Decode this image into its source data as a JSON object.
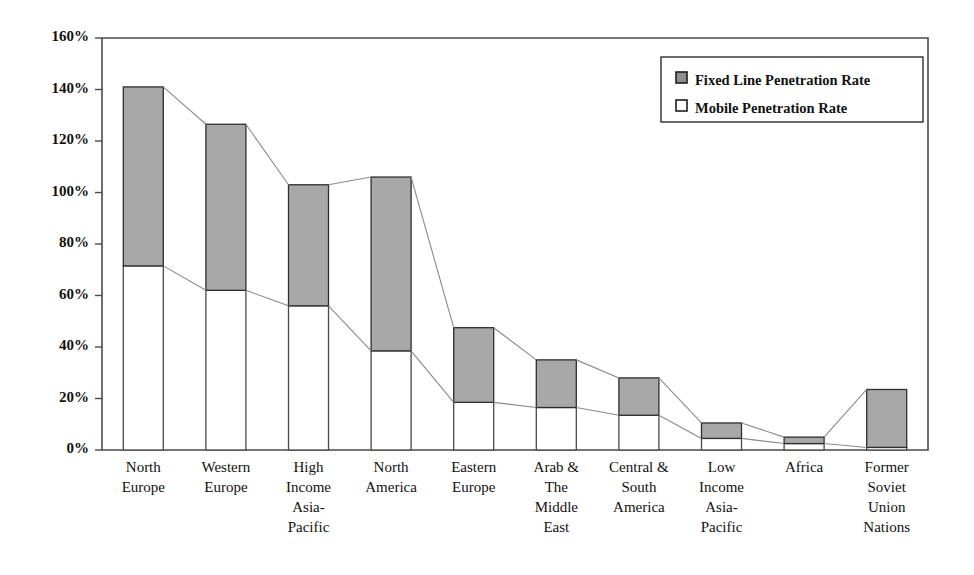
{
  "chart_data": {
    "type": "bar",
    "title": "",
    "xlabel": "",
    "ylabel": "",
    "ylim": [
      0,
      160
    ],
    "grid": false,
    "stacked": true,
    "legend_position": "top-right",
    "ytick_labels": [
      "0%",
      "20%",
      "40%",
      "60%",
      "80%",
      "100%",
      "120%",
      "140%",
      "160%"
    ],
    "ytick_values": [
      0,
      20,
      40,
      60,
      80,
      100,
      120,
      140,
      160
    ],
    "categories": [
      "North Europe",
      "Western Europe",
      "High Income Asia-Pacific",
      "North America",
      "Eastern Europe",
      "Arab & The Middle East",
      "Central & South America",
      "Low Income Asia-Pacific",
      "Africa",
      "Former Soviet Union Nations"
    ],
    "category_label_lines": [
      [
        "North",
        "Europe"
      ],
      [
        "Western",
        "Europe"
      ],
      [
        "High",
        "Income",
        "Asia-",
        "Pacific"
      ],
      [
        "North",
        "America"
      ],
      [
        "Eastern",
        "Europe"
      ],
      [
        "Arab &",
        "The",
        "Middle",
        "East"
      ],
      [
        "Central &",
        "South",
        "America"
      ],
      [
        "Low",
        "Income",
        "Asia-",
        "Pacific"
      ],
      [
        "Africa"
      ],
      [
        "Former",
        "Soviet",
        "Union",
        "Nations"
      ]
    ],
    "series": [
      {
        "name": "Mobile Penetration Rate",
        "color": "#ffffff",
        "values": [
          71.5,
          62,
          56,
          38.5,
          18.5,
          16.5,
          13.5,
          4.5,
          2.5,
          1
        ]
      },
      {
        "name": "Fixed Line Penetration Rate",
        "color": "#a8a8a8",
        "values": [
          69.5,
          64.5,
          47,
          67.5,
          29,
          18.5,
          14.5,
          6,
          2.5,
          22.5
        ]
      }
    ],
    "totals": [
      141,
      126.5,
      103,
      106,
      47.5,
      35,
      28,
      10.5,
      5,
      23.5
    ],
    "legend_entries": [
      {
        "label": "Fixed Line Penetration Rate",
        "swatch": "filled-gray"
      },
      {
        "label": "Mobile Penetration Rate",
        "swatch": "open-white"
      }
    ]
  },
  "colors": {
    "fixed_line": "#a8a8a8",
    "mobile": "#ffffff",
    "frame": "#4a4a4a",
    "connector": "#8a8a8a",
    "text": "#111111"
  }
}
